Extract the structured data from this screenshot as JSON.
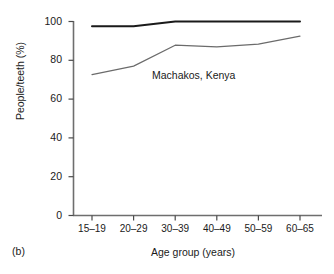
{
  "panel": {
    "label": "(b)"
  },
  "chart_data": {
    "type": "line",
    "title": "",
    "annotation": "Machakos, Kenya",
    "xlabel": "Age group (years)",
    "ylabel": "People/teeth (%)",
    "categories": [
      "15–19",
      "20–29",
      "30–39",
      "40–49",
      "50–59",
      "60–65"
    ],
    "ylim": [
      0,
      100
    ],
    "yticks": [
      0,
      20,
      40,
      60,
      80,
      100
    ],
    "ytick_labels": [
      "0",
      "20",
      "40",
      "60",
      "80",
      "100"
    ],
    "grid": false,
    "legend": "none",
    "series": [
      {
        "name": "upper",
        "color": "#1a1a1a",
        "width": 2.0,
        "values": [
          97.5,
          97.6,
          100.0,
          100.0,
          100.0,
          100.0
        ]
      },
      {
        "name": "lower",
        "color": "#6b6b6b",
        "width": 1.2,
        "values": [
          72.6,
          77.0,
          87.8,
          86.9,
          88.3,
          92.5
        ]
      }
    ]
  },
  "axes": {
    "spine_color": "#6e6e6e",
    "tick_color": "#4a4a4a"
  }
}
